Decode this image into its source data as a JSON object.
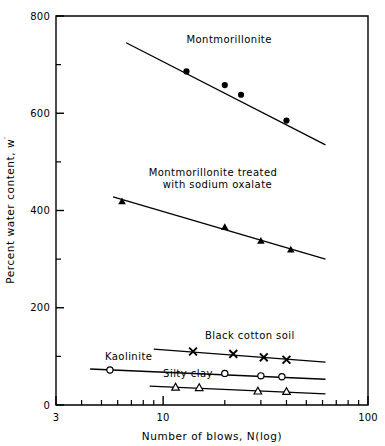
{
  "chart_data": {
    "type": "scatter",
    "title": "",
    "xlabel": "Number of blows, N(log)",
    "ylabel": "Percent water content, w′",
    "xscale": "log",
    "yscale": "linear",
    "xlim": [
      3,
      100
    ],
    "ylim": [
      0,
      800
    ],
    "grid": false,
    "legend_position": "inline-annotations",
    "x_tick_labels": [
      "3",
      "10",
      "100"
    ],
    "x_tick_values": [
      3,
      10,
      100
    ],
    "x_minor_ticks": [
      4,
      5,
      6,
      7,
      8,
      9,
      20,
      30,
      40,
      50,
      60,
      70,
      80,
      90
    ],
    "y_tick_labels": [
      "0",
      "200",
      "400",
      "600",
      "800"
    ],
    "y_tick_values": [
      0,
      200,
      400,
      600,
      800
    ],
    "y_minor_ticks": [
      100,
      300,
      500,
      700
    ],
    "series": [
      {
        "name": "Montmorillonite",
        "marker": "filled-circle",
        "label_x": 13.0,
        "label_y": 745,
        "fit_line": [
          [
            6.6,
            745
          ],
          [
            62,
            535
          ]
        ],
        "x": [
          13.0,
          20.0,
          24.0,
          40.0
        ],
        "y": [
          686,
          658,
          638,
          585
        ]
      },
      {
        "name": "Montmorillonite treated with sodium oxalate",
        "name_line1": "Montmorillonite treated",
        "name_line2": "with sodium oxalate",
        "marker": "filled-triangle",
        "label_x": 8.5,
        "label_y": 470,
        "fit_line": [
          [
            5.7,
            428
          ],
          [
            62,
            300
          ]
        ],
        "x": [
          6.3,
          20.0,
          30.0,
          42.0
        ],
        "y": [
          418,
          365,
          337,
          319
        ]
      },
      {
        "name": "Black cotton soil",
        "marker": "cross",
        "label_x": 16.0,
        "label_y": 135,
        "fit_line": [
          [
            9.0,
            115
          ],
          [
            62,
            88
          ]
        ],
        "x": [
          14.0,
          22.0,
          31.0,
          40.0
        ],
        "y": [
          110,
          105,
          98,
          93
        ]
      },
      {
        "name": "Kaolinite",
        "marker": "open-circle",
        "label_x": 5.2,
        "label_y": 92,
        "fit_line": [
          [
            4.4,
            74
          ],
          [
            62,
            53
          ]
        ],
        "x": [
          5.5,
          20.0,
          30.0,
          38.0
        ],
        "y": [
          72,
          65,
          60,
          58
        ]
      },
      {
        "name": "Silty clay",
        "marker": "open-triangle",
        "label_x": 10.0,
        "label_y": 58,
        "fit_line": [
          [
            8.6,
            39
          ],
          [
            62,
            23
          ]
        ],
        "x": [
          11.5,
          15.0,
          29.0,
          40.0
        ],
        "y": [
          36,
          35,
          28,
          27
        ]
      }
    ]
  },
  "axes": {
    "x_axis_title": "Number of blows, N(log)",
    "y_axis_title_main": "Percent water content, w",
    "y_axis_title_prime": "′"
  }
}
